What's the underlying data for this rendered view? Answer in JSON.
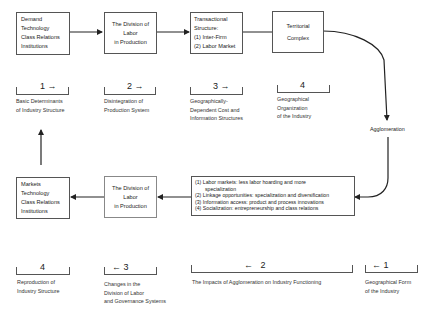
{
  "top_row": {
    "boxes": [
      {
        "lines": [
          "Demand",
          "Technology",
          "Class Relations",
          "Institutions"
        ]
      },
      {
        "lines": [
          "The Division of",
          "Labor",
          "in Production"
        ]
      },
      {
        "lines": [
          "Transactional",
          "Structure:",
          "(1) Inter-Firm",
          "(2) Labor Market"
        ]
      },
      {
        "lines": [
          "Territorial",
          "Complex"
        ]
      }
    ],
    "stages": [
      {
        "number": "1",
        "arrow": "→",
        "caption": [
          "Basic Determinants",
          "of Industry Structure"
        ]
      },
      {
        "number": "2",
        "arrow": "→",
        "caption": [
          "Disintegration of",
          "Production System"
        ]
      },
      {
        "number": "3",
        "arrow": "→",
        "caption": [
          "Geographically-",
          "Dependent Cost and",
          "Information Structures"
        ]
      },
      {
        "number": "4",
        "arrow": "",
        "caption": [
          "Geographical",
          "Organization",
          "of the Industry"
        ]
      }
    ]
  },
  "connector_label": "Agglomeration",
  "bottom_row": {
    "boxes": [
      {
        "lines": [
          "Markets",
          "Technology",
          "Class Relations",
          "Institutions"
        ]
      },
      {
        "lines": [
          "The Division of",
          "Labor",
          "in Production"
        ]
      },
      {
        "lines": [
          "(1) Labor markets: less labor hoarding and more",
          "      specialization",
          "(2) Linkage opportunities: specialization and diversification",
          "(3) Information access:  product and process innovations",
          "(4) Socialization: entrepreneurship and class relations"
        ]
      }
    ],
    "stages": [
      {
        "number": "4",
        "arrow": "",
        "caption": [
          "Reproduction of",
          "Industry Structure"
        ]
      },
      {
        "number": "3",
        "arrow": "←",
        "caption": [
          "Changes in the",
          "Division of Labor",
          "and Governance Systems"
        ]
      },
      {
        "number": "2",
        "arrow": "←",
        "caption": [
          "The Impacts of Agglomeration on Industry Functioning"
        ]
      },
      {
        "number": "1",
        "arrow": "←",
        "caption": [
          "Geographical Form",
          "of the Industry"
        ]
      }
    ]
  }
}
